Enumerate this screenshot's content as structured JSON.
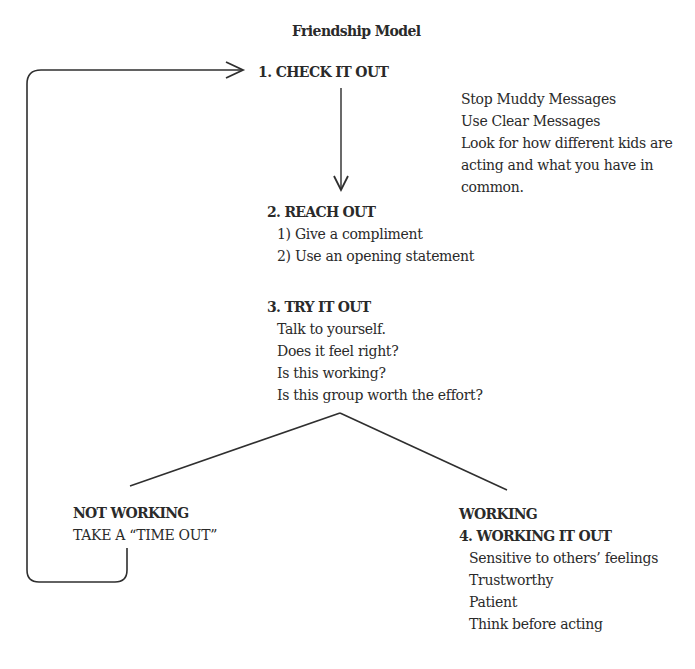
{
  "title": "Friendship Model",
  "steps": {
    "check_it_out": {
      "heading": "1. CHECK IT OUT",
      "notes": [
        "Stop Muddy Messages",
        "Use Clear Messages",
        "Look for how different kids are",
        "acting and what you have in",
        "common."
      ]
    },
    "reach_out": {
      "heading": "2. REACH OUT",
      "items": [
        "1) Give a compliment",
        "2) Use an opening statement"
      ]
    },
    "try_it_out": {
      "heading": "3. TRY IT OUT",
      "items": [
        "Talk to yourself.",
        "Does it feel right?",
        "Is this working?",
        "Is this group worth the effort?"
      ]
    },
    "not_working": {
      "heading": "NOT WORKING",
      "action": "TAKE A “TIME OUT”"
    },
    "working": {
      "heading": "WORKING",
      "subheading": "4. WORKING IT OUT",
      "items": [
        "Sensitive to others’ feelings",
        "Trustworthy",
        "Patient",
        "Think before acting"
      ]
    }
  },
  "connectors": {
    "loop_back_arrow": "from NOT WORKING back to 1. CHECK IT OUT",
    "down_arrow": "from 1. CHECK IT OUT to 2. REACH OUT",
    "branch": "3. TRY IT OUT splits to NOT WORKING and WORKING"
  },
  "colors": {
    "ink": "#2a2a2a",
    "background": "#ffffff"
  }
}
